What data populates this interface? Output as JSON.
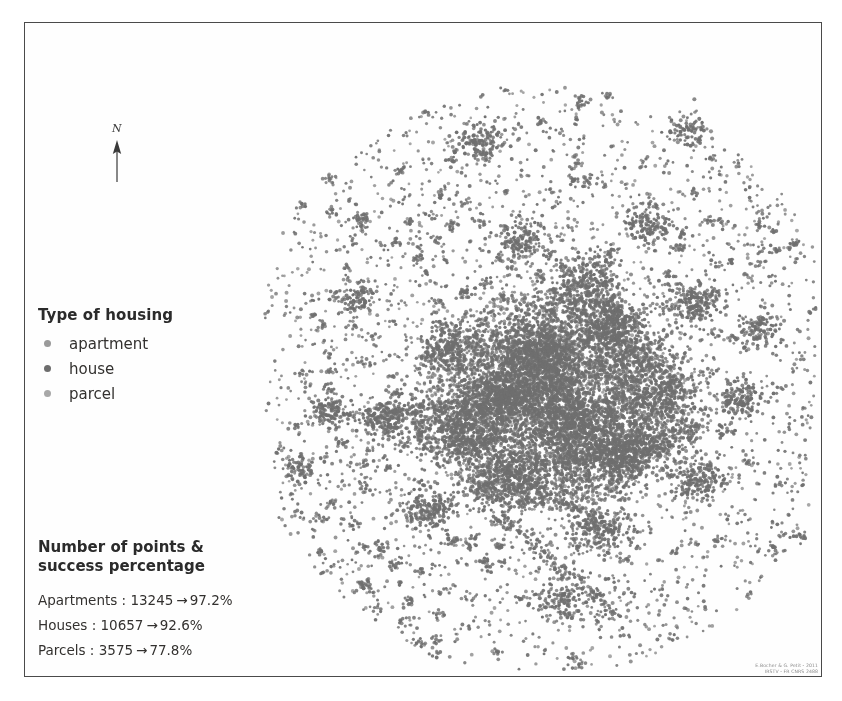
{
  "figure": {
    "background_color": "#ffffff",
    "frame_color": "#4a4a4a"
  },
  "north_arrow": {
    "label": "N",
    "name": "north-arrow"
  },
  "legend": {
    "title": "Type of housing",
    "items": [
      {
        "label": "apartment",
        "color": "#9a9a9a"
      },
      {
        "label": "house",
        "color": "#6d6d6d"
      },
      {
        "label": "parcel",
        "color": "#a8a8a8"
      }
    ]
  },
  "stats": {
    "title_line1": "Number of points &",
    "title_line2": "success percentage",
    "arrow": "→",
    "rows": [
      {
        "label": "Apartments :",
        "count": "13245",
        "percent": "97.2%"
      },
      {
        "label": "Houses :",
        "count": "10657",
        "percent": "92.6%"
      },
      {
        "label": "Parcels :",
        "count": "3575",
        "percent": "77.8%"
      }
    ]
  },
  "credit": {
    "line1": "E.Bocher & G. Petit - 2011",
    "line2": "IRSTV - FR CNRS 2488"
  },
  "chart_data": {
    "type": "scatter",
    "title": "Type of housing",
    "xlabel": "",
    "ylabel": "",
    "grid": false,
    "axes_visible": false,
    "legend_position": "left",
    "point_color": "#6f6f6f",
    "point_radius_px": 1.6,
    "series": [
      {
        "name": "apartment",
        "count": 13245,
        "success_percent": 97.2,
        "color": "#9a9a9a"
      },
      {
        "name": "house",
        "count": 10657,
        "success_percent": 92.6,
        "color": "#6d6d6d"
      },
      {
        "name": "parcel",
        "count": 3575,
        "success_percent": 77.8,
        "color": "#a8a8a8"
      }
    ],
    "total_points": 27477,
    "spatial_structure": {
      "description": "Urban point cloud of a city agglomeration: dense irregular core with radial corridors and scattered peripheral villages.",
      "core_center_px": [
        548,
        400
      ],
      "core_radius_px": 120,
      "extent_px": {
        "x_min": 265,
        "x_max": 815,
        "y_min": 45,
        "y_max": 670
      },
      "clusters": [
        {
          "cx": 540,
          "cy": 355,
          "sx": 45,
          "sy": 30,
          "n": 900
        },
        {
          "cx": 575,
          "cy": 420,
          "sx": 55,
          "sy": 35,
          "n": 950
        },
        {
          "cx": 500,
          "cy": 395,
          "sx": 38,
          "sy": 26,
          "n": 620
        },
        {
          "cx": 610,
          "cy": 330,
          "sx": 34,
          "sy": 30,
          "n": 430
        },
        {
          "cx": 620,
          "cy": 455,
          "sx": 42,
          "sy": 28,
          "n": 520
        },
        {
          "cx": 470,
          "cy": 440,
          "sx": 48,
          "sy": 22,
          "n": 420
        },
        {
          "cx": 515,
          "cy": 480,
          "sx": 40,
          "sy": 26,
          "n": 400
        },
        {
          "cx": 660,
          "cy": 395,
          "sx": 34,
          "sy": 30,
          "n": 330
        },
        {
          "cx": 455,
          "cy": 350,
          "sx": 28,
          "sy": 24,
          "n": 250
        },
        {
          "cx": 585,
          "cy": 285,
          "sx": 30,
          "sy": 26,
          "n": 260
        },
        {
          "cx": 690,
          "cy": 300,
          "sx": 26,
          "sy": 22,
          "n": 180
        },
        {
          "cx": 390,
          "cy": 420,
          "sx": 22,
          "sy": 16,
          "n": 150
        },
        {
          "cx": 330,
          "cy": 410,
          "sx": 18,
          "sy": 13,
          "n": 110
        },
        {
          "cx": 700,
          "cy": 480,
          "sx": 24,
          "sy": 20,
          "n": 160
        },
        {
          "cx": 430,
          "cy": 510,
          "sx": 22,
          "sy": 18,
          "n": 140
        },
        {
          "cx": 600,
          "cy": 530,
          "sx": 30,
          "sy": 22,
          "n": 200
        },
        {
          "cx": 740,
          "cy": 400,
          "sx": 22,
          "sy": 20,
          "n": 130
        },
        {
          "cx": 520,
          "cy": 240,
          "sx": 24,
          "sy": 20,
          "n": 140
        },
        {
          "cx": 650,
          "cy": 225,
          "sx": 22,
          "sy": 18,
          "n": 120
        },
        {
          "cx": 760,
          "cy": 330,
          "sx": 20,
          "sy": 18,
          "n": 100
        },
        {
          "cx": 360,
          "cy": 300,
          "sx": 18,
          "sy": 16,
          "n": 90
        },
        {
          "cx": 480,
          "cy": 140,
          "sx": 22,
          "sy": 18,
          "n": 110
        },
        {
          "cx": 690,
          "cy": 130,
          "sx": 20,
          "sy": 16,
          "n": 90
        },
        {
          "cx": 560,
          "cy": 600,
          "sx": 26,
          "sy": 18,
          "n": 110
        },
        {
          "cx": 300,
          "cy": 470,
          "sx": 16,
          "sy": 12,
          "n": 70
        }
      ],
      "corridors": [
        {
          "x1": 430,
          "y1": 430,
          "x2": 660,
          "y2": 350,
          "width": 10,
          "n": 420
        },
        {
          "x1": 470,
          "y1": 480,
          "x2": 700,
          "y2": 430,
          "width": 9,
          "n": 360
        },
        {
          "x1": 545,
          "y1": 300,
          "x2": 575,
          "y2": 520,
          "width": 9,
          "n": 320
        },
        {
          "x1": 350,
          "y1": 415,
          "x2": 520,
          "y2": 400,
          "width": 7,
          "n": 220
        },
        {
          "x1": 600,
          "y1": 250,
          "x2": 640,
          "y2": 430,
          "width": 7,
          "n": 200
        },
        {
          "x1": 505,
          "y1": 520,
          "x2": 620,
          "y2": 620,
          "width": 7,
          "n": 160
        }
      ],
      "halo": {
        "cx": 548,
        "cy": 380,
        "radius": 300,
        "n": 3000
      }
    }
  }
}
